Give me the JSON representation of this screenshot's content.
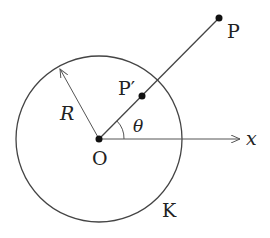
{
  "diagram": {
    "type": "geometry",
    "colors": {
      "stroke": "#333333",
      "point": "#111111",
      "background": "#ffffff"
    },
    "circle": {
      "label": "K",
      "center": [
        99,
        139
      ],
      "radius": 83
    },
    "radius_label": "R",
    "points": {
      "origin": {
        "label": "O",
        "pos": [
          99,
          139
        ]
      },
      "p": {
        "label": "P",
        "pos": [
          219,
          18
        ]
      },
      "p_prime": {
        "label": "P′",
        "pos": [
          142,
          96
        ]
      }
    },
    "axis": {
      "label": "x"
    },
    "angle": {
      "label": "θ"
    }
  }
}
